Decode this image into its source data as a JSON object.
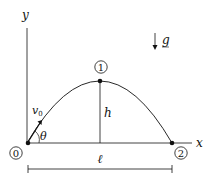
{
  "diagram": {
    "axes": {
      "x_label": "x",
      "y_label": "y"
    },
    "gravity_label": "g",
    "points": [
      {
        "id": "point-0",
        "label": "0"
      },
      {
        "id": "point-1",
        "label": "1"
      },
      {
        "id": "point-2",
        "label": "2"
      }
    ],
    "velocity_label": "v",
    "velocity_subscript": "0",
    "angle_label": "θ",
    "height_label": "h",
    "range_label": "ℓ",
    "colors": {
      "stroke": "#111111",
      "background": "#ffffff"
    }
  }
}
